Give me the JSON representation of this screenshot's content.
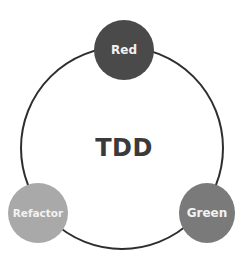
{
  "diagram": {
    "title": "TDD",
    "nodes": [
      {
        "id": "red",
        "label": "Red",
        "fill": "#4a4a4a"
      },
      {
        "id": "green",
        "label": "Green",
        "fill": "#7a7a7a"
      },
      {
        "id": "refactor",
        "label": "Refactor",
        "fill": "#a9a9a9"
      }
    ],
    "ring_color": "#2e2e2e",
    "flow": [
      "Red",
      "Green",
      "Refactor"
    ]
  }
}
